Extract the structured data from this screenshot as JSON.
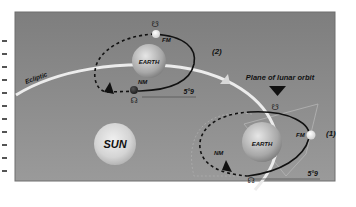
{
  "diagram": {
    "labels": {
      "ecliptic": "Ecliptic",
      "plane_of_lunar_orbit": "Plane of lunar orbit",
      "sun": "SUN",
      "earth_top": "EARTH",
      "earth_bottom": "EARTH",
      "fm_top": "FM",
      "nm_top": "NM",
      "fm_bottom": "FM",
      "nm_bottom": "NM",
      "position_2": "(2)",
      "position_1": "(1)",
      "angle_top": "5°9",
      "angle_bottom": "5°9",
      "ascending_node_symbol": "☊",
      "descending_node_symbol": "☋"
    },
    "colors": {
      "background": "#8a8a8a",
      "frame_border": "#6e6e6e",
      "ecliptic_line": "#ececec",
      "orbit_line": "#111111",
      "plane_outline": "#b5b5b5"
    }
  }
}
